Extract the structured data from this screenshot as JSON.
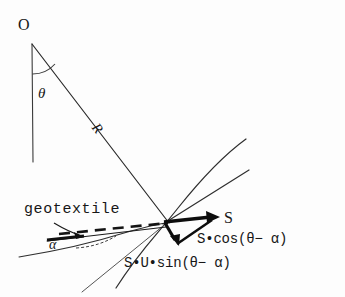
{
  "figure": {
    "background_color": "#fdfdfd",
    "ink_color": "#171717",
    "labels": {
      "center_point": "O",
      "angle_theta": "θ",
      "radius": "R",
      "geotextile": "geotextile",
      "angle_alpha": "α",
      "force_s": "S",
      "force_s_cos": "S•cos(θ− α)",
      "force_s_u_sin": "S•U•sin(θ− α)"
    },
    "geometry": {
      "center": [
        31,
        42
      ],
      "vertical_line_end": [
        33,
        162
      ],
      "radius_line_end": [
        168,
        222
      ],
      "theta_arc_radius": 30,
      "force_origin": [
        164,
        222
      ],
      "s_arrow_tip": [
        219,
        217
      ],
      "down_arrow_tip": [
        178,
        245
      ],
      "slip_circle_end": [
        246,
        139
      ],
      "tangent_line_end": [
        249,
        170
      ],
      "geotextile_dashed_start": [
        60,
        233
      ],
      "geotextile_dashed_end": [
        168,
        223
      ],
      "geotextile_solid_start": [
        48,
        240
      ],
      "geotextile_solid_end": [
        166,
        226
      ]
    }
  }
}
